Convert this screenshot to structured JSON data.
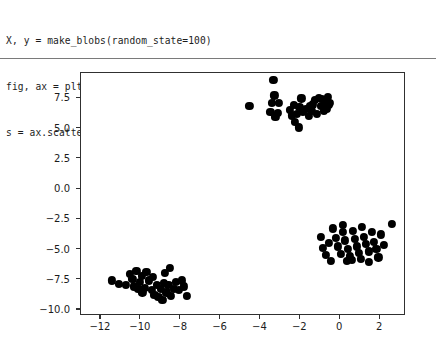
{
  "notebook": {
    "code_lines": [
      "X, y = make_blobs(random_state=100)",
      "fig, ax = plt.subplots()",
      "s = ax.scatter(*X.T)"
    ]
  },
  "chart_data": {
    "type": "scatter",
    "title": "",
    "xlabel": "",
    "ylabel": "",
    "xlim": [
      -13.0,
      3.3
    ],
    "ylim": [
      -10.5,
      9.6
    ],
    "xticks": [
      -12,
      -10,
      -8,
      -6,
      -4,
      -2,
      0,
      2
    ],
    "xtick_labels": [
      "−12",
      "−10",
      "−8",
      "−6",
      "−4",
      "−2",
      "0",
      "2"
    ],
    "yticks": [
      7.5,
      5.0,
      2.5,
      0.0,
      -2.5,
      -5.0,
      -7.5,
      -10.0
    ],
    "ytick_labels": [
      "7.5",
      "5.0",
      "2.5",
      "0.0",
      "−2.5",
      "−5.0",
      "−7.5",
      "−10.0"
    ],
    "grid": false,
    "legend": null,
    "marker_color": "#000000",
    "marker_size": 8.2,
    "n_points": 100,
    "series": [
      {
        "name": "blob-cluster-upper",
        "points": [
          [
            -4.55,
            6.85
          ],
          [
            -3.35,
            9.05
          ],
          [
            -3.3,
            7.75
          ],
          [
            -3.42,
            7.15
          ],
          [
            -3.08,
            7.1
          ],
          [
            -3.5,
            6.35
          ],
          [
            -3.14,
            6.3
          ],
          [
            -3.25,
            5.95
          ],
          [
            -2.52,
            6.55
          ],
          [
            -2.33,
            6.95
          ],
          [
            -2.05,
            6.8
          ],
          [
            -2.42,
            6.1
          ],
          [
            -2.18,
            6.2
          ],
          [
            -2.28,
            5.55
          ],
          [
            -1.88,
            6.35
          ],
          [
            -1.72,
            6.6
          ],
          [
            -1.58,
            6.05
          ],
          [
            -1.42,
            6.45
          ],
          [
            -2.08,
            5.1
          ],
          [
            -1.25,
            7.35
          ],
          [
            -1.08,
            7.55
          ],
          [
            -0.92,
            7.45
          ],
          [
            -0.75,
            7.1
          ],
          [
            -0.62,
            7.6
          ],
          [
            -0.52,
            7.15
          ],
          [
            -0.68,
            6.6
          ],
          [
            -0.82,
            6.45
          ],
          [
            -0.95,
            6.85
          ],
          [
            -1.38,
            7.0
          ],
          [
            -1.52,
            6.85
          ],
          [
            -0.58,
            6.95
          ],
          [
            -1.15,
            6.2
          ],
          [
            -1.95,
            7.5
          ]
        ]
      },
      {
        "name": "blob-cluster-lower-left",
        "points": [
          [
            -11.45,
            -7.55
          ],
          [
            -11.08,
            -7.85
          ],
          [
            -10.75,
            -7.95
          ],
          [
            -10.55,
            -7.05
          ],
          [
            -10.42,
            -7.45
          ],
          [
            -10.22,
            -6.75
          ],
          [
            -10.35,
            -8.05
          ],
          [
            -10.12,
            -8.25
          ],
          [
            -10.05,
            -7.65
          ],
          [
            -9.92,
            -8.55
          ],
          [
            -9.78,
            -8.15
          ],
          [
            -9.95,
            -7.15
          ],
          [
            -9.72,
            -6.85
          ],
          [
            -9.58,
            -7.55
          ],
          [
            -9.45,
            -8.35
          ],
          [
            -9.32,
            -8.75
          ],
          [
            -9.2,
            -7.95
          ],
          [
            -9.38,
            -7.25
          ],
          [
            -9.12,
            -8.95
          ],
          [
            -8.98,
            -8.25
          ],
          [
            -8.85,
            -7.75
          ],
          [
            -8.92,
            -9.15
          ],
          [
            -8.72,
            -8.55
          ],
          [
            -8.62,
            -7.95
          ],
          [
            -8.78,
            -6.95
          ],
          [
            -8.48,
            -8.85
          ],
          [
            -8.35,
            -8.25
          ],
          [
            -8.22,
            -7.65
          ],
          [
            -8.08,
            -8.35
          ],
          [
            -7.95,
            -7.55
          ],
          [
            -7.82,
            -8.05
          ],
          [
            -7.68,
            -8.85
          ],
          [
            -8.55,
            -6.55
          ]
        ]
      },
      {
        "name": "blob-cluster-right",
        "points": [
          [
            -0.95,
            -3.95
          ],
          [
            -0.85,
            -4.85
          ],
          [
            -0.72,
            -5.45
          ],
          [
            -0.55,
            -4.45
          ],
          [
            -0.35,
            -3.25
          ],
          [
            -0.22,
            -4.05
          ],
          [
            -0.12,
            -4.75
          ],
          [
            0.02,
            -5.35
          ],
          [
            0.15,
            -3.55
          ],
          [
            0.25,
            -4.25
          ],
          [
            0.38,
            -4.95
          ],
          [
            0.48,
            -5.55
          ],
          [
            0.12,
            -2.95
          ],
          [
            0.62,
            -3.45
          ],
          [
            0.72,
            -4.15
          ],
          [
            0.85,
            -4.75
          ],
          [
            0.95,
            -5.25
          ],
          [
            0.58,
            -5.85
          ],
          [
            1.08,
            -3.15
          ],
          [
            1.18,
            -3.95
          ],
          [
            1.28,
            -4.55
          ],
          [
            1.42,
            -5.15
          ],
          [
            1.05,
            -5.75
          ],
          [
            1.58,
            -3.55
          ],
          [
            1.68,
            -4.35
          ],
          [
            1.82,
            -4.95
          ],
          [
            1.45,
            -6.05
          ],
          [
            2.05,
            -3.75
          ],
          [
            2.18,
            -4.65
          ],
          [
            2.58,
            -2.85
          ],
          [
            0.32,
            -5.95
          ],
          [
            -0.48,
            -5.95
          ],
          [
            1.92,
            -5.65
          ]
        ]
      }
    ]
  }
}
